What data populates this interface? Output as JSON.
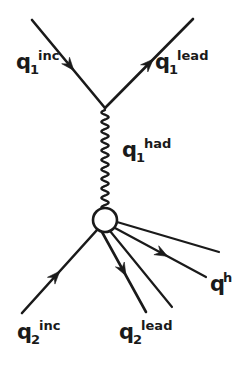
{
  "figure": {
    "kind": "feynman-diagram",
    "width": 248,
    "height": 368,
    "background_color": "#ffffff",
    "ink_color": "#1a1a1a"
  },
  "vertices": [
    {
      "name": "upper-vertex",
      "x": 105,
      "y": 108,
      "type": "point"
    },
    {
      "name": "lower-blob",
      "x": 105,
      "y": 220,
      "type": "circle",
      "radius": 12
    }
  ],
  "lines": [
    {
      "name": "q1-incoming-line",
      "x1": 32,
      "y1": 20,
      "x2": 105,
      "y2": 108,
      "width": 2.6,
      "arrow": {
        "t": 0.52,
        "size": 11
      }
    },
    {
      "name": "q1-lead-outgoing-line",
      "x1": 105,
      "y1": 108,
      "x2": 193,
      "y2": 19,
      "width": 2.6,
      "arrow": {
        "t": 0.5,
        "size": 11
      }
    },
    {
      "name": "q2-incoming-line",
      "x1": 22,
      "y1": 313,
      "x2": 97,
      "y2": 230,
      "width": 2.6,
      "arrow": {
        "t": 0.45,
        "size": 11
      }
    },
    {
      "name": "q2-lead-outgoing-line",
      "x1": 102,
      "y1": 232,
      "x2": 146,
      "y2": 312,
      "width": 2.6,
      "arrow": {
        "t": 0.48,
        "size": 11
      }
    },
    {
      "name": "hadron-line-1",
      "x1": 110,
      "y1": 231,
      "x2": 172,
      "y2": 307,
      "width": 2.2,
      "arrow": null
    },
    {
      "name": "hadron-line-2",
      "x1": 115,
      "y1": 228,
      "x2": 206,
      "y2": 277,
      "width": 2.2,
      "arrow": {
        "t": 0.52,
        "size": 11
      }
    },
    {
      "name": "hadron-line-3",
      "x1": 117,
      "y1": 222,
      "x2": 219,
      "y2": 252,
      "width": 2.2,
      "arrow": null
    }
  ],
  "gluon": {
    "name": "q1-had-gluon-propagator",
    "x1": 105,
    "y1": 110,
    "x2": 105,
    "y2": 208,
    "amplitude": 3.6,
    "period": 9.5,
    "width": 2.3
  },
  "labels": [
    {
      "name": "label-q1-inc",
      "base": "q",
      "sub": "1",
      "sup": "inc",
      "text": "q_1^inc",
      "x": 16,
      "y": 52
    },
    {
      "name": "label-q1-lead",
      "base": "q",
      "sub": "1",
      "sup": "lead",
      "text": "q_1^lead",
      "x": 155,
      "y": 52
    },
    {
      "name": "label-q1-had",
      "base": "q",
      "sub": "1",
      "sup": "had",
      "text": "q_1^had",
      "x": 122,
      "y": 140
    },
    {
      "name": "label-q2-inc",
      "base": "q",
      "sub": "2",
      "sup": "inc",
      "text": "q_2^inc",
      "x": 17,
      "y": 322
    },
    {
      "name": "label-q2-lead",
      "base": "q",
      "sub": "2",
      "sup": "lead",
      "text": "q_2^lead",
      "x": 119,
      "y": 322
    },
    {
      "name": "label-q-h",
      "base": "q",
      "sub": "",
      "sup": "h",
      "text": "q^h",
      "x": 210,
      "y": 274
    }
  ]
}
